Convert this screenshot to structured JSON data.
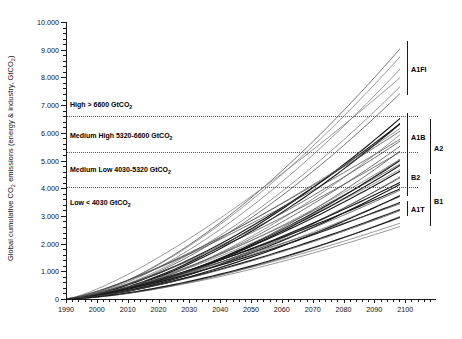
{
  "chart_data": {
    "type": "line",
    "title": "",
    "xlabel": "",
    "ylabel": "Global cumulative CO2 emissions (energy & industry, GtCO2)",
    "ylabel_parts": {
      "pre": "Global cumulative CO",
      "sub1": "2",
      "mid": " emissions (energy & industry, GtCO",
      "sub2": "2",
      "post": ")"
    },
    "xlim": [
      1990,
      2110
    ],
    "ylim": [
      0,
      10000
    ],
    "grid": false,
    "legend_position": "right-brackets",
    "x_ticks": [
      1990,
      2000,
      2010,
      2020,
      2030,
      2040,
      2050,
      2060,
      2070,
      2080,
      2090,
      2100
    ],
    "x_tick_labels": [
      "1990",
      "2000",
      "2010",
      "2020",
      "2030",
      "2040",
      "2050",
      "2060",
      "2070",
      "2080",
      "2090",
      "2100"
    ],
    "y_ticks": [
      0,
      1000,
      2000,
      3000,
      4000,
      5000,
      6000,
      7000,
      8000,
      9000,
      10000
    ],
    "y_tick_labels": [
      "0",
      "1.000",
      "2.000",
      "3.000",
      "4.000",
      "5.000",
      "6.000",
      "7.000",
      "8.000",
      "9.000",
      "10.000"
    ],
    "y_minor_step": 200,
    "thresholds": [
      {
        "name": "medium-high-upper",
        "value": 6600,
        "style": "dotted"
      },
      {
        "name": "medium-low-upper",
        "value": 5320,
        "style": "dotted"
      },
      {
        "name": "low-upper",
        "value": 4030,
        "style": "dotted"
      }
    ],
    "bands": [
      {
        "label": "High > 6600 GtCO",
        "sub": "2",
        "label_full": "High > 6600 GtCO2",
        "y_text": 7000,
        "range": [
          6600,
          10000
        ]
      },
      {
        "label": "Medium High 5320-6600 GtCO",
        "sub": "2",
        "label_full": "Medium High 5320-6600 GtCO2",
        "y_text": 5880,
        "range": [
          5320,
          6600
        ]
      },
      {
        "label": "Medium Low 4030-5320 GtCO",
        "sub": "2",
        "label_full": "Medium Low 4030-5320 GtCO2",
        "y_text": 4650,
        "range": [
          4030,
          5320
        ]
      },
      {
        "label": "Low < 4030 GtCO",
        "sub": "2",
        "label_full": "Low < 4030 GtCO2",
        "y_text": 3450,
        "range": [
          0,
          4030
        ]
      }
    ],
    "scenario_families": [
      {
        "name": "A1FI",
        "column": 1,
        "y_top": 9300,
        "y_bottom": 7350,
        "label_y": 8300
      },
      {
        "name": "A1B",
        "column": 1,
        "y_top": 6700,
        "y_bottom": 4950,
        "label_y": 5850
      },
      {
        "name": "B2",
        "column": 1,
        "y_top": 5180,
        "y_bottom": 3700,
        "label_y": 4400
      },
      {
        "name": "A1T",
        "column": 1,
        "y_top": 3520,
        "y_bottom": 3000,
        "label_y": 3250
      },
      {
        "name": "A2",
        "column": 2,
        "y_top": 6500,
        "y_bottom": 4500,
        "label_y": 5450
      },
      {
        "name": "B1",
        "column": 2,
        "y_top": 4330,
        "y_bottom": 2650,
        "label_y": 3550
      }
    ],
    "series_note": "40 SRES scenario trajectories, cumulative from 1990 origin at 0",
    "series": [
      {
        "name": "A1FI-1",
        "family": "A1FI",
        "end_2100": 9250
      },
      {
        "name": "A1FI-2",
        "family": "A1FI",
        "end_2100": 8950
      },
      {
        "name": "A1FI-3",
        "family": "A1FI",
        "end_2100": 8500
      },
      {
        "name": "A1FI-4",
        "family": "A1FI",
        "end_2100": 8150
      },
      {
        "name": "A1FI-5",
        "family": "A1FI",
        "end_2100": 7850
      },
      {
        "name": "A1FI-6",
        "family": "A1FI",
        "end_2100": 7600
      },
      {
        "name": "A1B-1",
        "family": "A1B",
        "end_2100": 6680
      },
      {
        "name": "A1B-2",
        "family": "A1B",
        "end_2100": 6480
      },
      {
        "name": "A1B-3",
        "family": "A1B",
        "end_2100": 6280
      },
      {
        "name": "A1B-4",
        "family": "A1B",
        "end_2100": 6080
      },
      {
        "name": "A1B-5",
        "family": "A1B",
        "end_2100": 5880
      },
      {
        "name": "A1B-6",
        "family": "A1B",
        "end_2100": 5650
      },
      {
        "name": "A1B-7",
        "family": "A1B",
        "end_2100": 5420
      },
      {
        "name": "A1B-8",
        "family": "A1B",
        "end_2100": 5180
      },
      {
        "name": "A1B-9",
        "family": "A1B",
        "end_2100": 4980
      },
      {
        "name": "A2-1",
        "family": "A2",
        "end_2100": 6480
      },
      {
        "name": "A2-2",
        "family": "A2",
        "end_2100": 6180
      },
      {
        "name": "A2-3",
        "family": "A2",
        "end_2100": 5820
      },
      {
        "name": "A2-4",
        "family": "A2",
        "end_2100": 5480
      },
      {
        "name": "A2-5",
        "family": "A2",
        "end_2100": 5120
      },
      {
        "name": "A2-6",
        "family": "A2",
        "end_2100": 4780
      },
      {
        "name": "A2-7",
        "family": "A2",
        "end_2100": 4520
      },
      {
        "name": "B2-1",
        "family": "B2",
        "end_2100": 5160
      },
      {
        "name": "B2-2",
        "family": "B2",
        "end_2100": 4940
      },
      {
        "name": "B2-3",
        "family": "B2",
        "end_2100": 4720
      },
      {
        "name": "B2-4",
        "family": "B2",
        "end_2100": 4480
      },
      {
        "name": "B2-5",
        "family": "B2",
        "end_2100": 4240
      },
      {
        "name": "B2-6",
        "family": "B2",
        "end_2100": 4010
      },
      {
        "name": "B2-7",
        "family": "B2",
        "end_2100": 3780
      },
      {
        "name": "B1-1",
        "family": "B1",
        "end_2100": 4300
      },
      {
        "name": "B1-2",
        "family": "B1",
        "end_2100": 4060
      },
      {
        "name": "B1-3",
        "family": "B1",
        "end_2100": 3820
      },
      {
        "name": "B1-4",
        "family": "B1",
        "end_2100": 3560
      },
      {
        "name": "B1-5",
        "family": "B1",
        "end_2100": 3300
      },
      {
        "name": "B1-6",
        "family": "B1",
        "end_2100": 3050
      },
      {
        "name": "B1-7",
        "family": "B1",
        "end_2100": 2800
      },
      {
        "name": "B1-8",
        "family": "B1",
        "end_2100": 2680
      },
      {
        "name": "A1T-1",
        "family": "A1T",
        "end_2100": 3500
      },
      {
        "name": "A1T-2",
        "family": "A1T",
        "end_2100": 3260
      },
      {
        "name": "A1T-3",
        "family": "A1T",
        "end_2100": 3020
      }
    ]
  }
}
